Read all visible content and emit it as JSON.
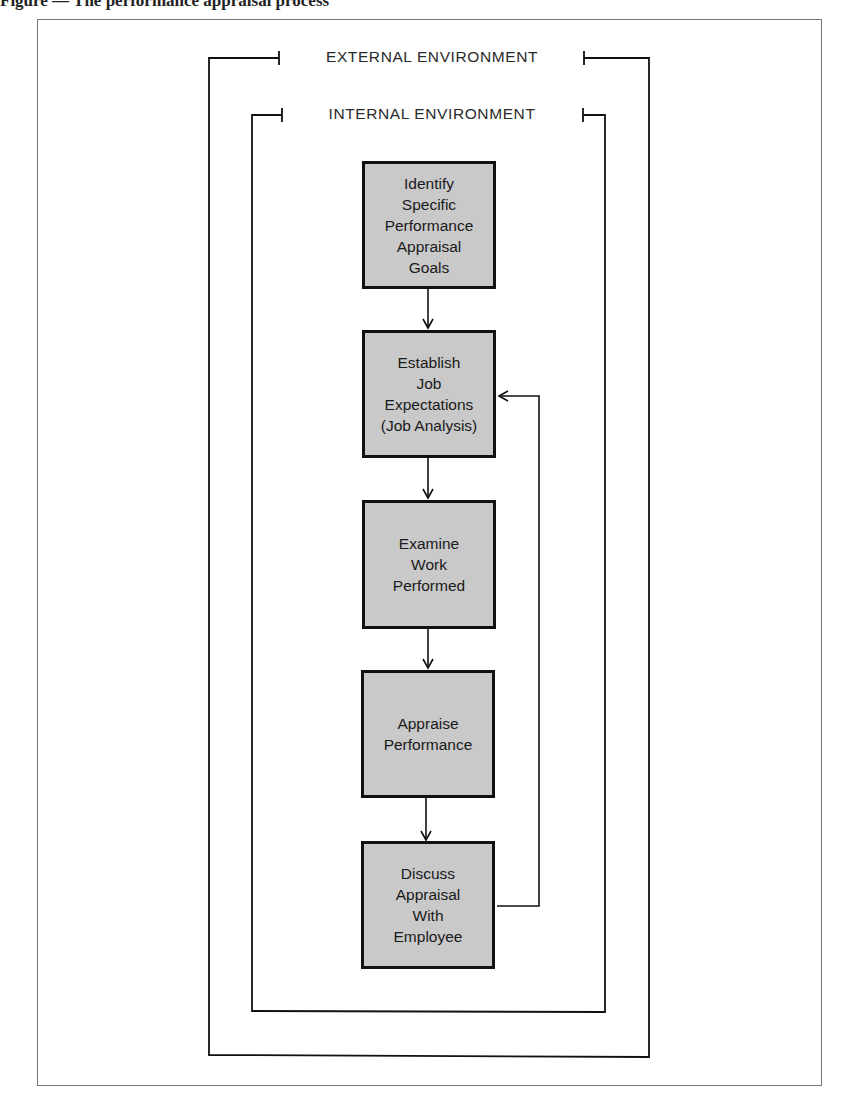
{
  "caption": {
    "text": "Figure — The performance appraisal process",
    "note": "Top caption is cropped; only the lower portion of the bold serif text is visible"
  },
  "frames": {
    "external": {
      "label": "EXTERNAL ENVIRONMENT"
    },
    "internal": {
      "label": "INTERNAL ENVIRONMENT"
    }
  },
  "steps": [
    {
      "id": "identify-goals",
      "label": "Identify\nSpecific\nPerformance\nAppraisal\nGoals"
    },
    {
      "id": "establish-expectations",
      "label": "Establish\nJob\nExpectations\n(Job Analysis)"
    },
    {
      "id": "examine-work",
      "label": "Examine\nWork\nPerformed"
    },
    {
      "id": "appraise-performance",
      "label": "Appraise\nPerformance"
    },
    {
      "id": "discuss-appraisal",
      "label": "Discuss\nAppraisal\nWith\nEmployee"
    }
  ],
  "connections": [
    {
      "from": "identify-goals",
      "to": "establish-expectations",
      "type": "arrow"
    },
    {
      "from": "establish-expectations",
      "to": "examine-work",
      "type": "arrow"
    },
    {
      "from": "examine-work",
      "to": "appraise-performance",
      "type": "arrow"
    },
    {
      "from": "appraise-performance",
      "to": "discuss-appraisal",
      "type": "arrow"
    },
    {
      "from": "discuss-appraisal",
      "to": "establish-expectations",
      "type": "feedback-arrow"
    }
  ],
  "colors": {
    "box_fill": "#c9c9c9",
    "box_border": "#111111",
    "line": "#111111",
    "page_border": "#777777"
  }
}
